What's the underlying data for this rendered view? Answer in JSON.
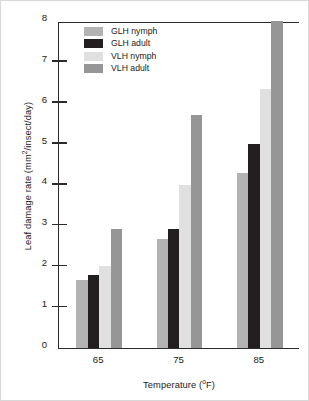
{
  "chart_data": {
    "type": "bar",
    "title": "",
    "xlabel": "Temperature (ºF)",
    "ylabel": "Leaf damage rate (mm²/insect/day)",
    "categories": [
      "65",
      "75",
      "85"
    ],
    "series": [
      {
        "name": "GLH nymph",
        "color": "#b3b3b3",
        "values": [
          1.67,
          2.67,
          4.28
        ]
      },
      {
        "name": "GLH adult",
        "color": "#231f20",
        "values": [
          1.79,
          2.91,
          4.98
        ]
      },
      {
        "name": "VLH nymph",
        "color": "#e0e0e0",
        "values": [
          2.0,
          3.98,
          6.34
        ]
      },
      {
        "name": "VLH adult",
        "color": "#969696",
        "values": [
          2.91,
          5.7,
          8.0
        ]
      }
    ],
    "ylim": [
      0,
      8
    ],
    "yticks": [
      "0",
      "1",
      "2",
      "3",
      "4",
      "5",
      "6",
      "7",
      "8"
    ],
    "grid": false,
    "legend_position": "upper-left"
  },
  "axis": {
    "ylabel_main": "Leaf damage rate (mm",
    "ylabel_sup": "2",
    "ylabel_tail": "/insect/day)",
    "xlabel_main": "Temperature (",
    "xlabel_sup": "o",
    "xlabel_tail": "F)"
  }
}
